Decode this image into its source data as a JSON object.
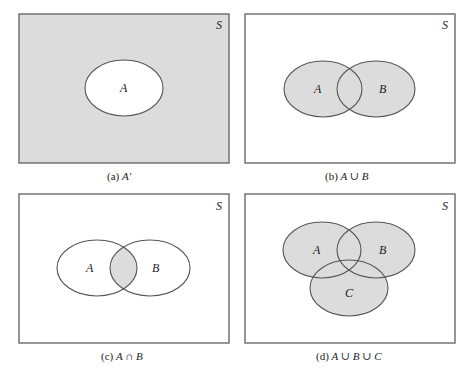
{
  "colors": {
    "shade": "#dcdcdc",
    "background": "#ffffff",
    "outline": "#555555",
    "frame": "#6a6a6a"
  },
  "universe_label": "S",
  "panels": [
    {
      "id": "a",
      "caption_prefix": "(a) ",
      "caption_expr": "A′",
      "description": "Complement of A",
      "sets": [
        "A"
      ],
      "shaded": "outside A"
    },
    {
      "id": "b",
      "caption_prefix": "(b) ",
      "caption_expr": "A ∪ B",
      "description": "Union of A and B",
      "sets": [
        "A",
        "B"
      ],
      "shaded": "A or B"
    },
    {
      "id": "c",
      "caption_prefix": "(c) ",
      "caption_expr": "A ∩ B",
      "description": "Intersection of A and B",
      "sets": [
        "A",
        "B"
      ],
      "shaded": "A and B"
    },
    {
      "id": "d",
      "caption_prefix": "(d) ",
      "caption_expr": "A ∪ B ∪ C",
      "description": "Union of A, B and C",
      "sets": [
        "A",
        "B",
        "C"
      ],
      "shaded": "A or B or C"
    }
  ]
}
